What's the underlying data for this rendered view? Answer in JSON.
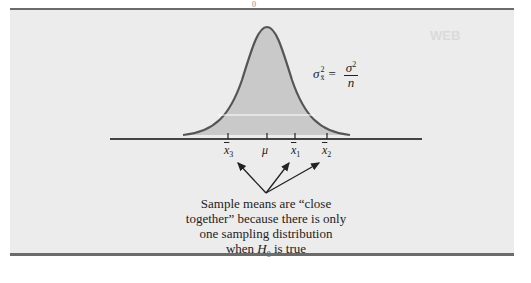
{
  "header_sliver": "0",
  "ghost_text": "WEB",
  "formula": {
    "lhs_symbol": "σ",
    "lhs_sup": "2",
    "lhs_sub": "x̄",
    "equals": "=",
    "numerator_symbol": "σ",
    "numerator_sup": "2",
    "denominator": "n"
  },
  "axis_labels": [
    {
      "id": "x3",
      "base": "x",
      "sub": "3"
    },
    {
      "id": "mu",
      "base": "μ",
      "sub": ""
    },
    {
      "id": "x1",
      "base": "x",
      "sub": "1"
    },
    {
      "id": "x2",
      "base": "x",
      "sub": "2"
    }
  ],
  "caption": {
    "line1": "Sample means are “close",
    "line2": "together” because there is only",
    "line3": "one sampling distribution",
    "line4_pre": "when ",
    "line4_var": "H",
    "line4_sub": "0",
    "line4_post": " is true"
  },
  "colors": {
    "panel": "#ececec",
    "curve_fill": "#c9c9c9",
    "curve_stroke": "#555555",
    "rule": "#6b6b6b"
  }
}
